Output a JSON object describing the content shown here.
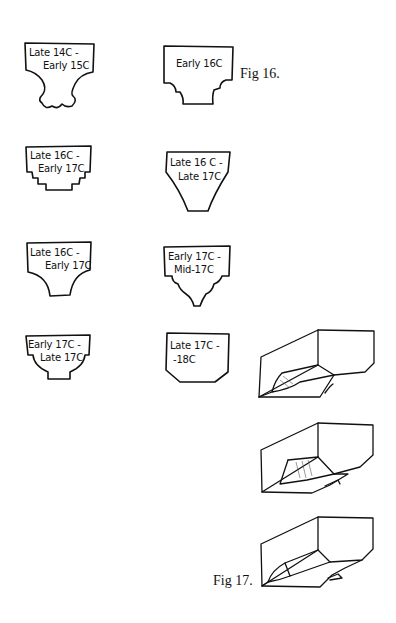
{
  "figures": {
    "fig16": {
      "caption": "Fig 16.",
      "profiles": [
        {
          "id": "p1",
          "line1": "Late 14C -",
          "line2": "Early 15C"
        },
        {
          "id": "p2",
          "line1": "Early 16C",
          "line2": ""
        },
        {
          "id": "p3",
          "line1": "Late 16C -",
          "line2": "Early 17C"
        },
        {
          "id": "p4",
          "line1": "Late 16 C -",
          "line2": "Late 17C"
        },
        {
          "id": "p5",
          "line1": "Late 16C -",
          "line2": "Early 17C"
        },
        {
          "id": "p6",
          "line1": "Early 17C -",
          "line2": "Mid-17C"
        },
        {
          "id": "p7",
          "line1": "Early 17C -",
          "line2": "Late 17C"
        },
        {
          "id": "p8",
          "line1": "Late 17C -",
          "line2": "-18C"
        }
      ]
    },
    "fig17": {
      "caption": "Fig 17.",
      "sketches": [
        "stop-chamfer-sketch-1",
        "stop-chamfer-sketch-2",
        "stop-chamfer-sketch-3"
      ]
    }
  },
  "colors": {
    "ink": "#111111",
    "paper": "#ffffff"
  }
}
